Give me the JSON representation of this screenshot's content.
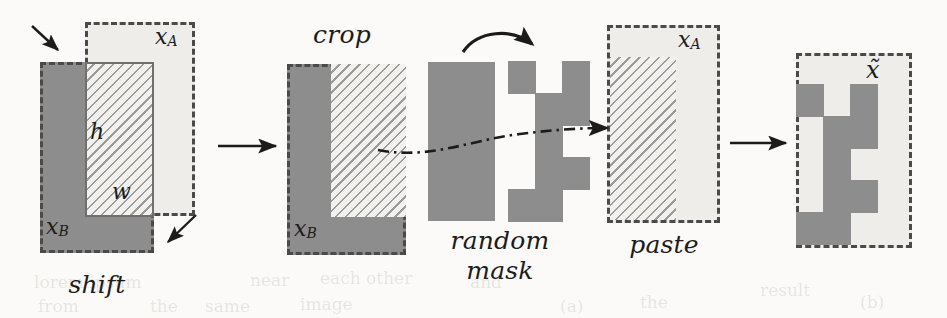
{
  "figure": {
    "background_color": "#fbfaf8",
    "fill_color": "#8d8d8d",
    "light_color": "#eeedea",
    "stroke_color": "#4a4a4a",
    "panels": [
      {
        "key": "shift",
        "step_label": "shift",
        "labels": {
          "source": "x",
          "source_sub": "A",
          "target": "x",
          "target_sub": "B",
          "height": "h",
          "width": "w"
        }
      },
      {
        "key": "crop",
        "step_label": "crop",
        "labels": {
          "target": "x",
          "target_sub": "B"
        }
      },
      {
        "key": "random_mask",
        "step_label_line1": "random",
        "step_label_line2": "mask"
      },
      {
        "key": "paste",
        "step_label": "paste",
        "labels": {
          "source": "x",
          "source_sub": "A"
        }
      },
      {
        "key": "result",
        "step_label": "",
        "labels": {
          "output": "x̃"
        }
      }
    ],
    "arrows": [
      {
        "name": "shift-to-crop",
        "type": "straight"
      },
      {
        "name": "mask-curved",
        "type": "curved"
      },
      {
        "name": "mask-to-paste",
        "type": "dash-dot"
      },
      {
        "name": "paste-to-result",
        "type": "straight"
      },
      {
        "name": "shift-hint-top",
        "type": "small-diagonal"
      },
      {
        "name": "shift-hint-bottom",
        "type": "small-diagonal"
      }
    ],
    "ghost_text": [
      {
        "text": "lorem ipsum",
        "x": 34,
        "y": 272
      },
      {
        "text": "near",
        "x": 250,
        "y": 270
      },
      {
        "text": "each other",
        "x": 320,
        "y": 268
      },
      {
        "text": "from",
        "x": 38,
        "y": 296
      },
      {
        "text": "the",
        "x": 150,
        "y": 296
      },
      {
        "text": "same",
        "x": 205,
        "y": 296
      },
      {
        "text": "image",
        "x": 300,
        "y": 294
      },
      {
        "text": "and",
        "x": 470,
        "y": 272
      },
      {
        "text": "(a)",
        "x": 560,
        "y": 296
      },
      {
        "text": "the",
        "x": 640,
        "y": 292
      },
      {
        "text": "result",
        "x": 760,
        "y": 280
      },
      {
        "text": "(b)",
        "x": 860,
        "y": 292
      }
    ]
  },
  "chart_data": {
    "type": "diagram",
    "stages": [
      "shift",
      "crop",
      "random mask",
      "paste",
      "x̃"
    ],
    "panel_geometry": {
      "shift": {
        "xA_box": {
          "x": 85,
          "y": 22,
          "w": 110,
          "h": 194,
          "style": "dashed-light"
        },
        "xB_box": {
          "x": 40,
          "y": 62,
          "w": 114,
          "h": 191,
          "style": "dashed-solid"
        },
        "overlap": {
          "x": 85,
          "y": 62,
          "w": 69,
          "h": 155,
          "style": "hatch"
        }
      },
      "crop": {
        "box": {
          "x": 287,
          "y": 64,
          "w": 119,
          "h": 191,
          "style": "dashed-solid"
        },
        "overlap": {
          "x": 331,
          "y": 64,
          "w": 75,
          "h": 153,
          "style": "hatch"
        }
      },
      "random_mask": {
        "source_block": {
          "x": 428,
          "y": 62,
          "w": 67,
          "h": 159
        },
        "mask_cells": {
          "cols": 3,
          "rows": 5,
          "cell_w": 27,
          "cell_h": 32,
          "origin_x": 508,
          "origin_y": 61
        },
        "mask_pattern": [
          [
            1,
            0,
            1
          ],
          [
            0,
            1,
            1
          ],
          [
            0,
            1,
            0
          ],
          [
            0,
            1,
            1
          ],
          [
            1,
            1,
            0
          ]
        ]
      },
      "paste": {
        "box": {
          "x": 607,
          "y": 25,
          "w": 113,
          "h": 198,
          "style": "dashed-light"
        },
        "hatch": {
          "x": 607,
          "y": 57,
          "w": 69,
          "h": 166,
          "style": "hatch"
        }
      },
      "result": {
        "box": {
          "x": 796,
          "y": 53,
          "w": 116,
          "h": 195,
          "style": "dashed-light"
        },
        "cells": {
          "cols": 3,
          "rows": 5,
          "cell_w": 27,
          "cell_h": 32,
          "origin_x": 796,
          "origin_y": 84
        },
        "pattern": [
          [
            1,
            0,
            1
          ],
          [
            0,
            1,
            1
          ],
          [
            0,
            1,
            0
          ],
          [
            0,
            1,
            1
          ],
          [
            1,
            1,
            0
          ]
        ]
      }
    }
  }
}
